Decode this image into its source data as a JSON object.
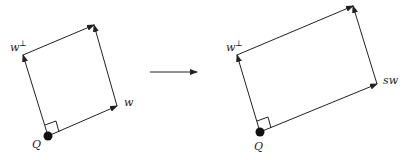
{
  "diagram": {
    "left": {
      "point_label": "Q",
      "vector_a_label": "w",
      "vector_b_label": "w",
      "vector_b_superscript": "⊥",
      "origin": [
        48,
        136
      ],
      "a_tip": [
        117,
        106
      ],
      "b_tip": [
        23,
        55
      ],
      "corner": [
        94,
        25
      ]
    },
    "transform_arrow": {
      "from": [
        150,
        72
      ],
      "to": [
        197,
        72
      ]
    },
    "right": {
      "point_label": "Q",
      "vector_a_label": "sw",
      "vector_b_label": "w",
      "vector_b_superscript": "⊥",
      "origin": [
        260,
        132
      ],
      "a_tip": [
        377,
        84
      ],
      "b_tip": [
        237,
        55
      ],
      "corner": [
        353,
        6
      ]
    },
    "colors": {
      "stroke": "#222222",
      "background": "#ffffff"
    }
  }
}
